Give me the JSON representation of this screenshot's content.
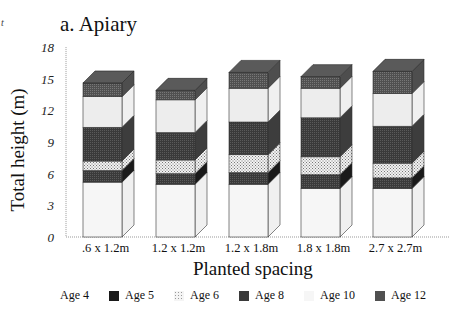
{
  "chart_data": {
    "type": "bar",
    "subtype": "stacked-3d",
    "title": "a. Apiary",
    "xlabel": "Planted spacing",
    "ylabel": "Total height (m)",
    "ylim": [
      0,
      18
    ],
    "yticks": [
      0,
      3,
      6,
      9,
      12,
      15,
      18
    ],
    "grid": false,
    "legend_position": "bottom",
    "categories": [
      ".6 x 1.2m",
      "1.2 x 1.2m",
      "1.2 x 1.8m",
      "1.8 x 1.8m",
      "2.7 x 2.7m"
    ],
    "cumulative_tops_note": "values are cumulative stacked heights (m) at top of each age segment",
    "series": [
      {
        "name": "Age 4",
        "values": [
          5.2,
          5.0,
          5.0,
          4.6,
          4.6
        ]
      },
      {
        "name": "Age 5",
        "values": [
          6.3,
          6.0,
          6.1,
          5.9,
          5.6
        ]
      },
      {
        "name": "Age 6",
        "values": [
          7.2,
          7.3,
          7.8,
          7.6,
          7.0
        ]
      },
      {
        "name": "Age 8",
        "values": [
          10.4,
          9.9,
          10.9,
          11.3,
          10.5
        ]
      },
      {
        "name": "Age 10",
        "values": [
          13.3,
          13.0,
          14.1,
          14.1,
          13.6
        ]
      },
      {
        "name": "Age 12",
        "values": [
          14.6,
          13.9,
          15.6,
          15.2,
          15.7
        ]
      }
    ],
    "series_colors": {
      "Age 4": "#f4f4f4",
      "Age 5": "#1e1e1e",
      "Age 6": "#d8d8d8",
      "Age 8": "#3e3e3e",
      "Age 10": "#ececec",
      "Age 12": "#555555"
    }
  },
  "labels": {
    "title": "a. Apiary",
    "corner_mark": "t",
    "xlabel": "Planted spacing",
    "ylabel": "Total height (m)"
  },
  "legend": [
    {
      "label": "Age 4",
      "color": "#f4f4f4"
    },
    {
      "label": "Age 5",
      "color": "#1e1e1e"
    },
    {
      "label": "Age 6",
      "color": "#d8d8d8"
    },
    {
      "label": "Age 8",
      "color": "#3e3e3e"
    },
    {
      "label": "Age 10",
      "color": "#ececec"
    },
    {
      "label": "Age 12",
      "color": "#555555"
    }
  ]
}
